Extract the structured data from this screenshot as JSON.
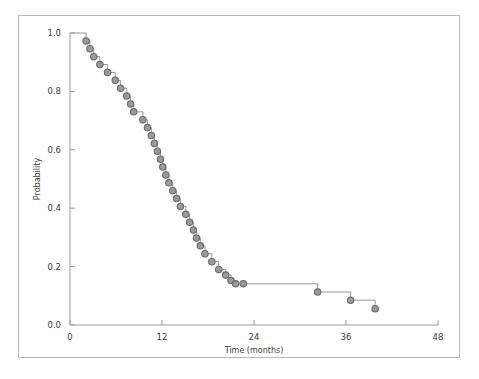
{
  "figure": {
    "frame_color": "#b9b9b9",
    "background": "#ffffff"
  },
  "chart_data": {
    "type": "line",
    "subtype": "kaplan-meier-step",
    "title": "",
    "subtitle": "",
    "xlabel": "Time (months)",
    "ylabel": "Probability",
    "xlim": [
      0,
      48
    ],
    "ylim": [
      0.0,
      1.0
    ],
    "xticks": [
      0,
      12,
      24,
      36,
      48
    ],
    "xtick_labels": [
      "0",
      "12",
      "24",
      "36",
      "48"
    ],
    "yticks": [
      0.0,
      0.2,
      0.4,
      0.6,
      0.8,
      1.0
    ],
    "ytick_labels": [
      "0.0",
      "0.2",
      "0.4",
      "0.6",
      "0.8",
      "1.0"
    ],
    "grid": false,
    "legend": null,
    "legend_position": "none",
    "line_color": "#8a8a8a",
    "marker_color": "#6a6a6a",
    "marker_fill": "#9a9a9a",
    "marker_shape": "circle",
    "marker_size": 3.2,
    "line_width": 0.9,
    "annotations": [],
    "series": [
      {
        "name": "Survival probability",
        "x": [
          0.0,
          2.1,
          2.6,
          3.1,
          3.9,
          4.9,
          5.9,
          6.6,
          7.4,
          7.9,
          8.3,
          9.5,
          10.1,
          10.6,
          11.0,
          11.4,
          11.8,
          12.1,
          12.5,
          12.9,
          13.4,
          13.9,
          14.4,
          15.1,
          15.6,
          16.1,
          16.5,
          17.0,
          17.6,
          18.5,
          19.4,
          20.3,
          21.0,
          21.6,
          22.6,
          32.3,
          36.6,
          39.8
        ],
        "y": [
          1.0,
          0.973,
          0.946,
          0.919,
          0.892,
          0.865,
          0.838,
          0.811,
          0.784,
          0.757,
          0.73,
          0.703,
          0.676,
          0.649,
          0.622,
          0.595,
          0.568,
          0.541,
          0.514,
          0.487,
          0.46,
          0.433,
          0.406,
          0.379,
          0.352,
          0.325,
          0.298,
          0.271,
          0.244,
          0.217,
          0.19,
          0.171,
          0.152,
          0.141,
          0.141,
          0.113,
          0.085,
          0.056
        ],
        "event_points": [
          {
            "x": 2.1,
            "y": 0.973
          },
          {
            "x": 2.6,
            "y": 0.946
          },
          {
            "x": 3.1,
            "y": 0.919
          },
          {
            "x": 3.9,
            "y": 0.892
          },
          {
            "x": 4.9,
            "y": 0.865
          },
          {
            "x": 5.9,
            "y": 0.838
          },
          {
            "x": 6.6,
            "y": 0.811
          },
          {
            "x": 7.4,
            "y": 0.784
          },
          {
            "x": 7.9,
            "y": 0.757
          },
          {
            "x": 8.3,
            "y": 0.73
          },
          {
            "x": 9.5,
            "y": 0.703
          },
          {
            "x": 10.1,
            "y": 0.676
          },
          {
            "x": 10.6,
            "y": 0.649
          },
          {
            "x": 11.0,
            "y": 0.622
          },
          {
            "x": 11.4,
            "y": 0.595
          },
          {
            "x": 11.8,
            "y": 0.568
          },
          {
            "x": 12.1,
            "y": 0.541
          },
          {
            "x": 12.5,
            "y": 0.514
          },
          {
            "x": 12.9,
            "y": 0.487
          },
          {
            "x": 13.4,
            "y": 0.46
          },
          {
            "x": 13.9,
            "y": 0.433
          },
          {
            "x": 14.4,
            "y": 0.406
          },
          {
            "x": 15.1,
            "y": 0.379
          },
          {
            "x": 15.6,
            "y": 0.352
          },
          {
            "x": 16.1,
            "y": 0.325
          },
          {
            "x": 16.5,
            "y": 0.298
          },
          {
            "x": 17.0,
            "y": 0.271
          },
          {
            "x": 17.6,
            "y": 0.244
          },
          {
            "x": 18.5,
            "y": 0.217
          },
          {
            "x": 19.4,
            "y": 0.19
          },
          {
            "x": 20.3,
            "y": 0.171
          },
          {
            "x": 21.0,
            "y": 0.152
          },
          {
            "x": 21.6,
            "y": 0.141
          },
          {
            "x": 22.6,
            "y": 0.141
          },
          {
            "x": 32.3,
            "y": 0.113
          },
          {
            "x": 36.6,
            "y": 0.085
          },
          {
            "x": 39.8,
            "y": 0.056
          }
        ]
      }
    ]
  }
}
